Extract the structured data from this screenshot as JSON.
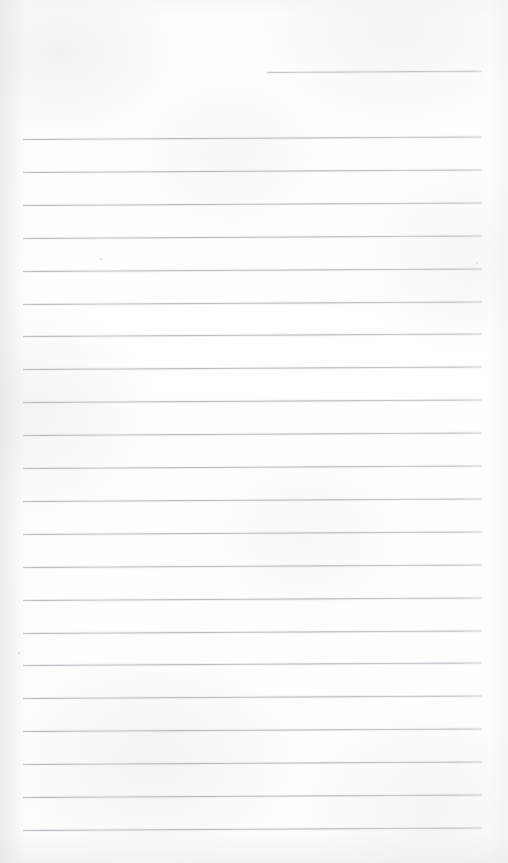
{
  "document": {
    "kind": "scanned-blank-ruled-notepaper",
    "title": "Blank Ruled Notepaper Scan",
    "width_px": 508,
    "height_px": 863,
    "has_text_content": "false",
    "visible_text": "",
    "background_color": "#fdfdfc",
    "rule_color": "#b0b4b9",
    "rule_thickness_px": 1,
    "rule_count_total": 23,
    "rule_count_full_width": 22,
    "rule_count_partial": 1,
    "rule_spacing_px": 32.9,
    "rule_left_x": 23,
    "rule_right_x": 482,
    "rule_tilt_deg": -0.32,
    "margin_rule": "none",
    "header_area": "blank"
  },
  "rules": [
    {
      "name": "rule-partial-top",
      "x": 267,
      "y": 72,
      "width": 215,
      "variant": "partial"
    },
    {
      "name": "rule-01",
      "x": 23,
      "y": 139.0,
      "width": 459,
      "variant": "full"
    },
    {
      "name": "rule-02",
      "x": 23,
      "y": 171.9,
      "width": 459,
      "variant": "full"
    },
    {
      "name": "rule-03",
      "x": 23,
      "y": 204.8,
      "width": 459,
      "variant": "full"
    },
    {
      "name": "rule-04",
      "x": 23,
      "y": 237.7,
      "width": 459,
      "variant": "full"
    },
    {
      "name": "rule-05",
      "x": 23,
      "y": 270.6,
      "width": 459,
      "variant": "full"
    },
    {
      "name": "rule-06",
      "x": 23,
      "y": 303.5,
      "width": 459,
      "variant": "full"
    },
    {
      "name": "rule-07",
      "x": 23,
      "y": 336.4,
      "width": 459,
      "variant": "full"
    },
    {
      "name": "rule-08",
      "x": 23,
      "y": 369.3,
      "width": 459,
      "variant": "full"
    },
    {
      "name": "rule-09",
      "x": 23,
      "y": 402.2,
      "width": 459,
      "variant": "full"
    },
    {
      "name": "rule-10",
      "x": 23,
      "y": 435.1,
      "width": 459,
      "variant": "full"
    },
    {
      "name": "rule-11",
      "x": 23,
      "y": 468.0,
      "width": 459,
      "variant": "full"
    },
    {
      "name": "rule-12",
      "x": 23,
      "y": 500.9,
      "width": 459,
      "variant": "full"
    },
    {
      "name": "rule-13",
      "x": 23,
      "y": 533.8,
      "width": 459,
      "variant": "full"
    },
    {
      "name": "rule-14",
      "x": 23,
      "y": 566.7,
      "width": 459,
      "variant": "full"
    },
    {
      "name": "rule-15",
      "x": 23,
      "y": 599.6,
      "width": 459,
      "variant": "full"
    },
    {
      "name": "rule-16",
      "x": 23,
      "y": 632.5,
      "width": 459,
      "variant": "full"
    },
    {
      "name": "rule-17",
      "x": 23,
      "y": 665.4,
      "width": 459,
      "variant": "full"
    },
    {
      "name": "rule-18",
      "x": 23,
      "y": 698.3,
      "width": 459,
      "variant": "full"
    },
    {
      "name": "rule-19",
      "x": 23,
      "y": 731.2,
      "width": 459,
      "variant": "full"
    },
    {
      "name": "rule-20",
      "x": 23,
      "y": 764.1,
      "width": 459,
      "variant": "full"
    },
    {
      "name": "rule-21",
      "x": 23,
      "y": 797.0,
      "width": 459,
      "variant": "full"
    },
    {
      "name": "rule-22",
      "x": 23,
      "y": 829.9,
      "width": 459,
      "variant": "full"
    }
  ],
  "artifacts": [
    {
      "name": "paper-speck",
      "x": 100,
      "y": 258,
      "size": 2
    },
    {
      "name": "paper-speck",
      "x": 476,
      "y": 262,
      "size": 2
    },
    {
      "name": "paper-speck",
      "x": 18,
      "y": 652,
      "size": 2
    }
  ]
}
